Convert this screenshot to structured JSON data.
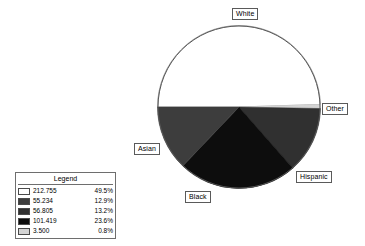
{
  "chart_data": {
    "type": "pie",
    "title": "",
    "categories": [
      "White",
      "Asian",
      "Hispanic",
      "Black",
      "Other"
    ],
    "values": [
      212755,
      55234,
      56805,
      101419,
      3500
    ],
    "percents": [
      49.5,
      12.9,
      13.2,
      23.6,
      0.8
    ],
    "value_labels": [
      "212.755",
      "55.234",
      "56.805",
      "101.419",
      "3.500"
    ],
    "percent_labels": [
      "49.5%",
      "12.9%",
      "13.2%",
      "23.6%",
      "0.8%"
    ],
    "colors": [
      "#ffffff",
      "#3d3d3d",
      "#303030",
      "#0d0d0d",
      "#d4d4d4"
    ],
    "legend_position": "bottom-left",
    "grid": false,
    "xlabel": "",
    "ylabel": ""
  },
  "pie": {
    "slices": [
      {
        "name": "White",
        "value_label": "212.755",
        "percent_label": "49.5%",
        "percent": 49.5,
        "color": "#ffffff",
        "label": "White"
      },
      {
        "name": "Other",
        "value_label": "3.500",
        "percent_label": "0.8%",
        "percent": 0.8,
        "color": "#d4d4d4",
        "label": "Other"
      },
      {
        "name": "Hispanic",
        "value_label": "56.805",
        "percent_label": "13.2%",
        "percent": 13.2,
        "color": "#303030",
        "label": "Hispanic"
      },
      {
        "name": "Black",
        "value_label": "101.419",
        "percent_label": "23.6%",
        "percent": 23.6,
        "color": "#0d0d0d",
        "label": "Black"
      },
      {
        "name": "Asian",
        "value_label": "55.234",
        "percent_label": "12.9%",
        "percent": 12.9,
        "color": "#3d3d3d",
        "label": "Asian"
      }
    ],
    "outline_color": "#555555"
  },
  "labels": {
    "white": "White",
    "other": "Other",
    "hispanic": "Hispanic",
    "black": "Black",
    "asian": "Asian"
  },
  "legend": {
    "title": "Legend",
    "rows": [
      {
        "swatch": "#ffffff",
        "value": "212.755",
        "percent": "49.5%"
      },
      {
        "swatch": "#3d3d3d",
        "value": "55.234",
        "percent": "12.9%"
      },
      {
        "swatch": "#303030",
        "value": "56.805",
        "percent": "13.2%"
      },
      {
        "swatch": "#0d0d0d",
        "value": "101.419",
        "percent": "23.6%"
      },
      {
        "swatch": "#d4d4d4",
        "value": "3.500",
        "percent": "0.8%"
      }
    ]
  }
}
